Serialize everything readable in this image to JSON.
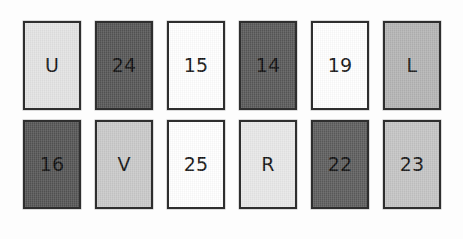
{
  "figure": {
    "type": "card-grid",
    "background_color": "#fdfdfd",
    "border_color": "#2e2e2e",
    "rows": 2,
    "columns": 6
  },
  "rows": [
    {
      "name": "top-row",
      "cards": [
        {
          "label": "U",
          "fill": "#e3e3e3",
          "tone": "light"
        },
        {
          "label": "24",
          "fill": "#555555",
          "tone": "dark"
        },
        {
          "label": "15",
          "fill": "#ffffff",
          "tone": "white"
        },
        {
          "label": "14",
          "fill": "#585858",
          "tone": "dark"
        },
        {
          "label": "19",
          "fill": "#ffffff",
          "tone": "white"
        },
        {
          "label": "L",
          "fill": "#b4b4b4",
          "tone": "medium"
        }
      ]
    },
    {
      "name": "bottom-row",
      "cards": [
        {
          "label": "16",
          "fill": "#545454",
          "tone": "dark"
        },
        {
          "label": "V",
          "fill": "#c9c9c9",
          "tone": "medium"
        },
        {
          "label": "25",
          "fill": "#ffffff",
          "tone": "white"
        },
        {
          "label": "R",
          "fill": "#e8e8e8",
          "tone": "light"
        },
        {
          "label": "22",
          "fill": "#5c5c5c",
          "tone": "dark"
        },
        {
          "label": "23",
          "fill": "#c4c4c4",
          "tone": "medium"
        }
      ]
    }
  ]
}
